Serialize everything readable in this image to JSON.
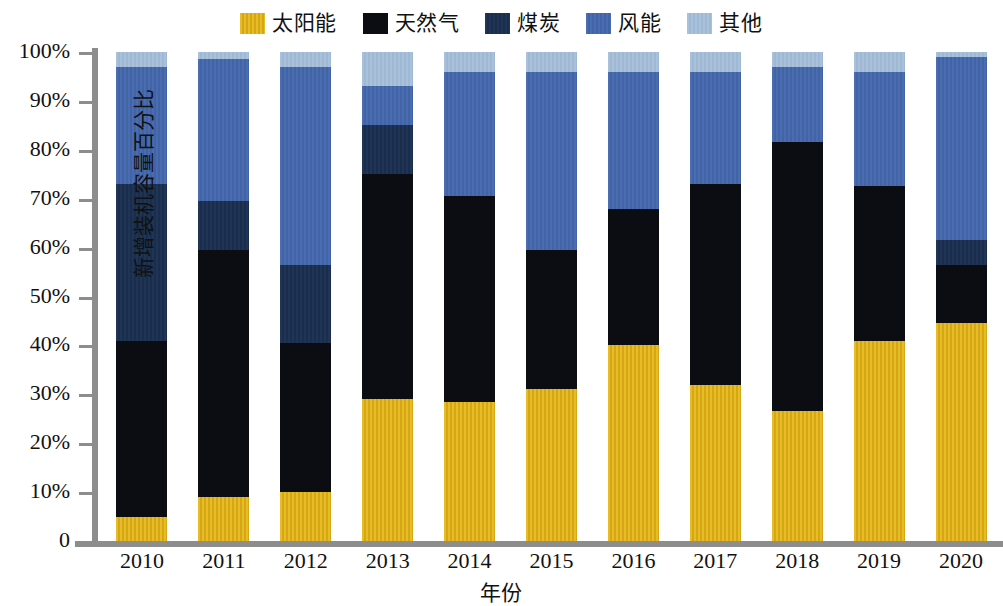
{
  "chart_data": {
    "type": "bar",
    "stacked": true,
    "normalized": true,
    "title": "",
    "xlabel": "年份",
    "ylabel": "新增装机容量百分比",
    "ylim": [
      0,
      100
    ],
    "yticks": [
      0,
      10,
      20,
      30,
      40,
      50,
      60,
      70,
      80,
      90,
      100
    ],
    "ytick_labels": [
      "0",
      "10%",
      "20%",
      "30%",
      "40%",
      "50%",
      "60%",
      "70%",
      "80%",
      "90%",
      "100%"
    ],
    "grid": false,
    "legend_position": "top-center",
    "categories": [
      "2010",
      "2011",
      "2012",
      "2013",
      "2014",
      "2015",
      "2016",
      "2017",
      "2018",
      "2019",
      "2020"
    ],
    "series": [
      {
        "name": "太阳能",
        "color": "#e0b21e",
        "values": [
          5,
          9,
          10,
          29,
          28.5,
          31,
          40,
          32,
          26.5,
          41,
          44.5
        ]
      },
      {
        "name": "天然气",
        "color": "#0b0d12",
        "values": [
          36,
          50.5,
          30.5,
          46,
          42,
          28.5,
          28,
          41,
          55,
          31.5,
          12
        ]
      },
      {
        "name": "煤炭",
        "color": "#1e3555",
        "values": [
          32,
          10,
          16,
          10,
          0,
          0,
          0,
          0,
          0,
          0,
          5
        ]
      },
      {
        "name": "风能",
        "color": "#4a6cb0",
        "values": [
          24,
          29,
          40.5,
          8,
          25.5,
          36.5,
          28,
          23,
          15.5,
          23.5,
          37.5
        ]
      },
      {
        "name": "其他",
        "color": "#a9c1da",
        "values": [
          3,
          1.5,
          3,
          7,
          4,
          4,
          4,
          4,
          3,
          4,
          1
        ]
      }
    ]
  }
}
